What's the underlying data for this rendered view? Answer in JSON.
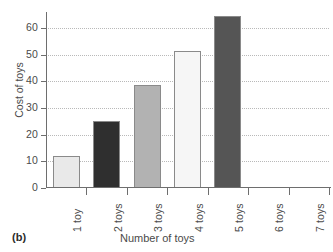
{
  "panel": {
    "label": "(b)"
  },
  "chart_data": {
    "type": "bar",
    "title": "",
    "xlabel": "Number of toys",
    "ylabel": "Cost of toys",
    "categories": [
      "1 toy",
      "2 toys",
      "3 toys",
      "4 toys",
      "5 toys",
      "6 toys",
      "7 toys"
    ],
    "values": [
      12,
      25,
      38.5,
      51.5,
      64.5,
      null,
      null
    ],
    "bar_colors": [
      "#e9e9e9",
      "#2f2f2f",
      "#b2b2b2",
      "#f6f6f6",
      "#555555",
      null,
      null
    ],
    "bar_edge_color": "#8a8a8a",
    "ylim": [
      0,
      66
    ],
    "yticks": [
      0,
      10,
      20,
      30,
      40,
      50,
      60
    ],
    "ytick_labels": [
      "0",
      "10",
      "20",
      "30",
      "40",
      "50",
      "60"
    ],
    "grid": true,
    "grid_axis": "y",
    "grid_style": "dotted",
    "grid_color": "#b9b9b9",
    "legend": false,
    "xtick_label_rotation": 90,
    "axis_color": "#6e6e6e"
  }
}
